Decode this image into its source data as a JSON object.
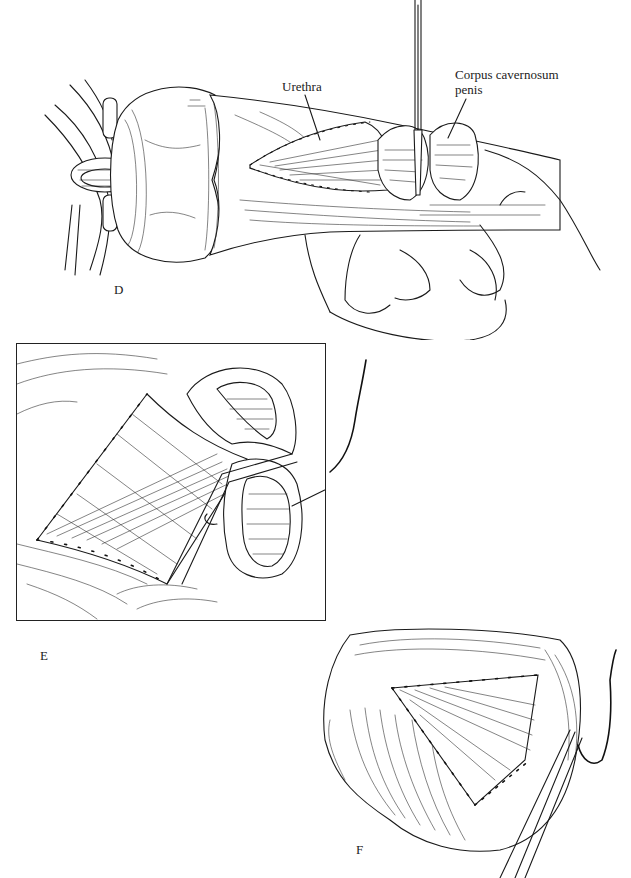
{
  "figure": {
    "panels": [
      {
        "id": "D",
        "letter": "D",
        "description": "Penile shaft held between fingers; urethral flap sutured along its margins; instrument retracting the corpus cavernosum",
        "labels": [
          {
            "text": "Urethra",
            "target": "urethral-flap"
          },
          {
            "text": "Corpus cavernosum",
            "line2": "penis",
            "target": "corpus-cavernosum"
          }
        ]
      },
      {
        "id": "E",
        "letter": "E",
        "description": "Framed close-up of triangular sutured flap with everted corpora and a needle with suture",
        "labels": []
      },
      {
        "id": "F",
        "letter": "F",
        "description": "Completed triangular suture line with forceps and suture at right",
        "labels": []
      }
    ],
    "labels": {
      "urethra": "Urethra",
      "corpus_line1": "Corpus cavernosum",
      "corpus_line2": "penis"
    },
    "letters": {
      "d": "D",
      "e": "E",
      "f": "F"
    },
    "colors": {
      "ink": "#1a1a1a",
      "background": "#ffffff"
    }
  }
}
